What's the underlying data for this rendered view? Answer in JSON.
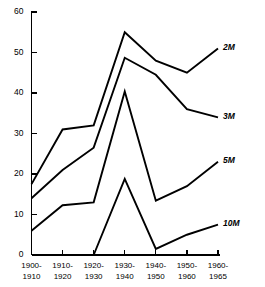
{
  "chart_data": {
    "type": "line",
    "title": "",
    "subtitle": "",
    "xlabel": "",
    "ylabel": "",
    "grid": false,
    "legend_position": "right-inline-end-labels",
    "categories": [
      "1900-1910",
      "1910-1920",
      "1920-1930",
      "1930-1940",
      "1940-1950",
      "1950-1960",
      "1960-1965"
    ],
    "xtick_labels": [
      [
        "1900-",
        "1910"
      ],
      [
        "1910-",
        "1920"
      ],
      [
        "1920-",
        "1930"
      ],
      [
        "1930-",
        "1940"
      ],
      [
        "1940-",
        "1950"
      ],
      [
        "1950-",
        "1960"
      ],
      [
        "1960-",
        "1965"
      ]
    ],
    "ylim": [
      0,
      60
    ],
    "ytick_labels": [
      "0",
      "10",
      "20",
      "30",
      "40",
      "50",
      "60"
    ],
    "ytick_values": [
      0,
      10,
      20,
      30,
      40,
      50,
      60
    ],
    "series": [
      {
        "name": "2M",
        "label": "2M",
        "color": "#000000",
        "values": [
          17.5,
          31.0,
          32.0,
          55.0,
          48.0,
          45.0,
          51.0
        ]
      },
      {
        "name": "3M",
        "label": "3M",
        "color": "#000000",
        "values": [
          14.0,
          21.0,
          26.5,
          48.7,
          44.5,
          36.0,
          34.0
        ]
      },
      {
        "name": "5M",
        "label": "5M",
        "color": "#000000",
        "values": [
          6.0,
          12.3,
          13.0,
          40.4,
          13.4,
          17.0,
          23.0
        ]
      },
      {
        "name": "10M",
        "label": "10M",
        "color": "#000000",
        "values": [
          null,
          null,
          0.0,
          18.8,
          1.5,
          5.0,
          7.5
        ]
      }
    ]
  },
  "figure": {
    "background_color": "#ffffff",
    "axis_color": "#000000",
    "line_color": "#000000"
  }
}
